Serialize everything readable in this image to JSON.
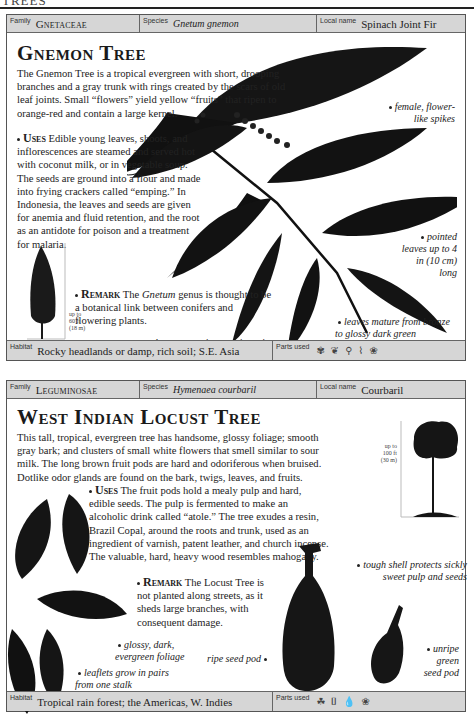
{
  "page": {
    "running_head": "TREES"
  },
  "entries": [
    {
      "family_label": "Family",
      "family": "Gnetaceae",
      "species_label": "Species",
      "species": "Gnetum gnemon",
      "local_name_label": "Local name",
      "local_name": "Spinach Joint Fir",
      "title": "Gnemon Tree",
      "intro": "The Gnemon Tree is a tropical evergreen with short, drooping branches and a gray trunk with rings created by the scars of old leaf joints. Small “flowers” yield yellow “fruits” that ripen to orange-red and contain a large kernel.",
      "uses_label": "Uses",
      "uses": "Edible young leaves, shoots, and inflorescences are steamed and served hot with coconut milk, or in vegetable soup. The seeds are ground into a flour and made into frying crackers called “emping.” In Indonesia, the leaves and seeds are given for anemia and fluid retention, and the root as an antidote for poison and a treatment for malaria.",
      "remark_label": "Remark",
      "remark_pre": "The ",
      "remark_em": "Gnetum",
      "remark_post": " genus is thought to be a botanical link between conifers and flowering plants.",
      "height_note": [
        "up to",
        "60 ft",
        "(18 m)"
      ],
      "captions": {
        "spikes": "female, flower-like spikes",
        "pointed": "pointed leaves up to 4 in (10 cm) long",
        "opposite": "leaves grow in opposite pairs",
        "mature": "leaves mature from bronze to glossy dark green"
      },
      "habitat_label": "Habitat",
      "habitat": "Rocky headlands or damp, rich soil; S.E. Asia",
      "parts_label": "Parts used",
      "parts_icons": [
        "flower-icon",
        "leaf-icon",
        "seed-icon",
        "root-icon",
        "fruit-icon"
      ]
    },
    {
      "family_label": "Family",
      "family": "Leguminosae",
      "species_label": "Species",
      "species": "Hymenaea courbaril",
      "local_name_label": "Local name",
      "local_name": "Courbaril",
      "title": "West Indian Locust Tree",
      "intro": "This tall, tropical, evergreen tree has handsome, glossy foliage; smooth gray bark; and clusters of small white flowers that smell similar to sour milk. The long brown fruit pods are hard and odoriferous when bruised. Dotlike odor glands are found on the bark, twigs, leaves, and fruits.",
      "uses_label": "Uses",
      "uses": "The fruit pods hold a mealy pulp and hard, edible seeds. The pulp is fermented to make an alcoholic drink called “atole.” The tree exudes a resin, Brazil Copal, around the roots and trunk, used as an ingredient of varnish, patent leather, and church incense. The valuable, hard, heavy wood resembles mahogany.",
      "remark_label": "Remark",
      "remark": "The Locust Tree is not planted along streets, as it sheds large branches, with consequent damage.",
      "height_note": [
        "up to",
        "100 ft",
        "(30 m)"
      ],
      "captions": {
        "shell": "tough shell protects sickly sweet pulp and seeds",
        "glossy": "glossy, dark, evergreen foliage",
        "ripe": "ripe seed pod",
        "unripe": "unripe green seed pod",
        "leaflets": "leaflets grow in pairs from one stalk"
      },
      "habitat_label": "Habitat",
      "habitat": "Tropical rain forest; the Americas, W. Indies",
      "parts_label": "Parts used",
      "parts_icons": [
        "fruit-icon",
        "bark-icon",
        "resin-icon",
        "seed-icon"
      ]
    }
  ]
}
